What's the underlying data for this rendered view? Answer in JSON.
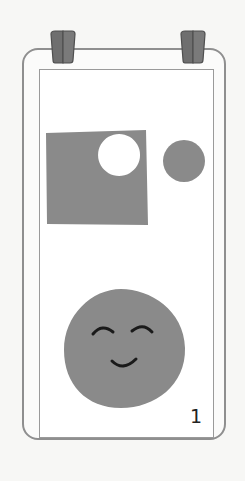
{
  "card": {
    "page_number": "1",
    "colors": {
      "background": "#f7f7f5",
      "card_outline": "#8f8f8f",
      "frame_outline": "#9a9a9a",
      "shape_fill": "#8a8a8a",
      "clip_fill": "#6f6f6f",
      "clip_outline": "#4f4f4f",
      "face_features": "#1a1a1a"
    },
    "illustration": {
      "shapes": [
        {
          "type": "square-with-circular-hole",
          "label": "gray square with white circle cut out"
        },
        {
          "type": "circle",
          "label": "small gray circle"
        },
        {
          "type": "smiling-face",
          "label": "gray round face with closed happy eyes and smile"
        }
      ]
    },
    "clips": [
      "left-clip",
      "right-clip"
    ]
  }
}
